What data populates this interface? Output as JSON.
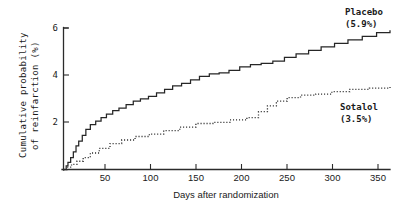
{
  "chart_data": {
    "type": "line",
    "title": "",
    "xlabel": "Days after randomization",
    "ylabel": "Cumulative probability of reinfarction (%)",
    "ylabel_line1": "Cumulative probability",
    "ylabel_line2": "of reinfarction (%)",
    "xlim": [
      0,
      365
    ],
    "ylim": [
      0,
      6
    ],
    "xticks": [
      50,
      100,
      150,
      200,
      250,
      300,
      350
    ],
    "xtick_labels": [
      "50",
      "100",
      "150",
      "200",
      "250",
      "300",
      "350"
    ],
    "yticks": [
      2,
      4,
      6
    ],
    "ytick_labels": [
      "2",
      "4",
      "6"
    ],
    "grid": false,
    "legend_position": "inline-right",
    "step_style": "post",
    "annotations": [
      {
        "name": "placebo",
        "line1": "Placebo",
        "line2": "(5.9%)",
        "final_value": 5.9
      },
      {
        "name": "sotalol",
        "line1": "Sotalol",
        "line2": "(3.5%)",
        "final_value": 3.5
      }
    ],
    "series": [
      {
        "name": "Placebo",
        "label_line1": "Placebo",
        "label_line2": "(5.9%)",
        "final_value": 5.9,
        "style": "solid",
        "color": "#262626",
        "x": [
          0,
          3,
          5,
          8,
          11,
          14,
          17,
          21,
          25,
          30,
          36,
          42,
          48,
          55,
          62,
          70,
          78,
          86,
          95,
          104,
          113,
          122,
          132,
          142,
          152,
          163,
          174,
          185,
          197,
          209,
          221,
          234,
          247,
          260,
          274,
          288,
          303,
          318,
          334,
          350,
          365
        ],
        "y": [
          0.0,
          0.15,
          0.3,
          0.5,
          0.75,
          1.0,
          1.2,
          1.45,
          1.7,
          1.9,
          2.05,
          2.2,
          2.35,
          2.5,
          2.6,
          2.75,
          2.9,
          3.0,
          3.1,
          3.25,
          3.4,
          3.55,
          3.65,
          3.8,
          3.95,
          4.05,
          4.1,
          4.2,
          4.35,
          4.45,
          4.5,
          4.6,
          4.75,
          4.9,
          5.05,
          5.2,
          5.35,
          5.5,
          5.65,
          5.8,
          5.9
        ]
      },
      {
        "name": "Sotalol",
        "label_line1": "Sotalol",
        "label_line2": "(3.5%)",
        "final_value": 3.5,
        "style": "dotted",
        "color": "#2e2e2e",
        "x": [
          0,
          4,
          9,
          15,
          22,
          30,
          40,
          52,
          65,
          80,
          96,
          112,
          130,
          148,
          167,
          186,
          205,
          218,
          228,
          238,
          250,
          265,
          282,
          300,
          320,
          342,
          365
        ],
        "y": [
          0.0,
          0.1,
          0.22,
          0.35,
          0.5,
          0.7,
          0.9,
          1.1,
          1.25,
          1.4,
          1.5,
          1.65,
          1.8,
          1.95,
          2.0,
          2.1,
          2.2,
          2.45,
          2.7,
          2.9,
          3.05,
          3.15,
          3.2,
          3.3,
          3.4,
          3.45,
          3.5
        ]
      }
    ]
  }
}
